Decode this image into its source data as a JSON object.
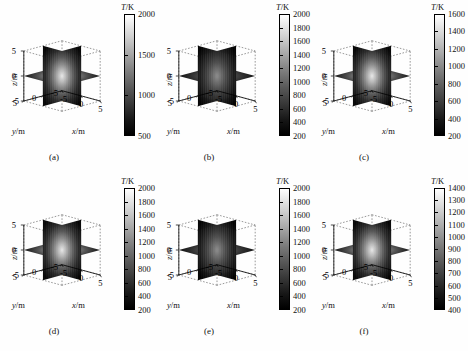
{
  "figure": {
    "colorbar_title": "T/K",
    "colorbar_title_sym": "T",
    "colorbar_title_unit": "/K",
    "axis_labels": {
      "x": "x/m",
      "y": "y/m",
      "z": "z/m",
      "x_sym": "x",
      "y_sym": "y",
      "z_sym": "z",
      "unit": "/m"
    },
    "axis_ticks": {
      "x": [
        "-5",
        "0",
        "5"
      ],
      "y": [
        "5",
        "0",
        "-5"
      ],
      "z": [
        "5",
        "0",
        "-5"
      ]
    },
    "colormap": "grayscale",
    "colors": {
      "high": "#ffffff",
      "low": "#000000",
      "line": "#000000",
      "background": "#ffffff"
    }
  },
  "panels": [
    {
      "id": "a",
      "caption": "(a)",
      "colorbar": {
        "title": "T/K",
        "ticks": [
          "2000",
          "1500",
          "1000",
          "500"
        ],
        "min": 500,
        "max": 2000,
        "step": 500
      }
    },
    {
      "id": "b",
      "caption": "(b)",
      "colorbar": {
        "title": "T/K",
        "ticks": [
          "2000",
          "1800",
          "1600",
          "1400",
          "1200",
          "1000",
          "800",
          "600",
          "400",
          "200"
        ],
        "min": 200,
        "max": 2000,
        "step": 200
      }
    },
    {
      "id": "c",
      "caption": "(c)",
      "colorbar": {
        "title": "T/K",
        "ticks": [
          "1600",
          "1400",
          "1200",
          "1000",
          "800",
          "600",
          "400",
          "200"
        ],
        "min": 200,
        "max": 1600,
        "step": 200
      }
    },
    {
      "id": "d",
      "caption": "(d)",
      "colorbar": {
        "title": "T/K",
        "ticks": [
          "2000",
          "1800",
          "1600",
          "1400",
          "1200",
          "1000",
          "800",
          "600",
          "400",
          "200"
        ],
        "min": 200,
        "max": 2000,
        "step": 200
      }
    },
    {
      "id": "e",
      "caption": "(e)",
      "colorbar": {
        "title": "T/K",
        "ticks": [
          "2000",
          "1800",
          "1600",
          "1400",
          "1200",
          "1000",
          "800",
          "600",
          "400",
          "200"
        ],
        "min": 200,
        "max": 2000,
        "step": 200
      }
    },
    {
      "id": "f",
      "caption": "(f)",
      "colorbar": {
        "title": "T/K",
        "ticks": [
          "1400",
          "1300",
          "1200",
          "1100",
          "1000",
          "900",
          "800",
          "700",
          "600",
          "500",
          "400"
        ],
        "min": 400,
        "max": 1400,
        "step": 100
      }
    }
  ],
  "chart_data": {
    "type": "heatmap",
    "title": "",
    "subtitle": "",
    "xlabel": "x/m",
    "ylabel": "y/m",
    "zlabel": "z/m",
    "xlim": [
      -5,
      5
    ],
    "ylim": [
      -5,
      5
    ],
    "zlim": [
      -5,
      5
    ],
    "xticks": [
      -5,
      0,
      5
    ],
    "yticks": [
      -5,
      0,
      5
    ],
    "zticks": [
      -5,
      0,
      5
    ],
    "grid": true,
    "legend": "none",
    "colorbar_label": "T/K",
    "colormap": "gray",
    "panels": [
      {
        "id": "a",
        "caption": "(a)",
        "clim": [
          500,
          2000
        ],
        "cticks": [
          500,
          1000,
          1500,
          2000
        ],
        "core_peak": 2000,
        "edge_value": 500
      },
      {
        "id": "b",
        "caption": "(b)",
        "clim": [
          200,
          2000
        ],
        "cticks": [
          200,
          400,
          600,
          800,
          1000,
          1200,
          1400,
          1600,
          1800,
          2000
        ],
        "core_peak": 2000,
        "edge_value": 200
      },
      {
        "id": "c",
        "caption": "(c)",
        "clim": [
          200,
          1600
        ],
        "cticks": [
          200,
          400,
          600,
          800,
          1000,
          1200,
          1400,
          1600
        ],
        "core_peak": 1600,
        "edge_value": 200
      },
      {
        "id": "d",
        "caption": "(d)",
        "clim": [
          200,
          2000
        ],
        "cticks": [
          200,
          400,
          600,
          800,
          1000,
          1200,
          1400,
          1600,
          1800,
          2000
        ],
        "core_peak": 2000,
        "edge_value": 200
      },
      {
        "id": "e",
        "caption": "(e)",
        "clim": [
          200,
          2000
        ],
        "cticks": [
          200,
          400,
          600,
          800,
          1000,
          1200,
          1400,
          1600,
          1800,
          2000
        ],
        "core_peak": 2000,
        "edge_value": 200
      },
      {
        "id": "f",
        "caption": "(f)",
        "clim": [
          400,
          1400
        ],
        "cticks": [
          400,
          500,
          600,
          700,
          800,
          900,
          1000,
          1100,
          1200,
          1300,
          1400
        ],
        "core_peak": 1400,
        "edge_value": 400
      }
    ]
  }
}
